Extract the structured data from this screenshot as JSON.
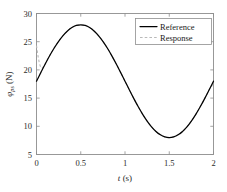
{
  "chart_data": {
    "type": "line",
    "title": "",
    "xlabel": "t (s)",
    "xlabel_sym": "t",
    "xlabel_unit": "(s)",
    "ylabel": "φ_ps (N)",
    "ylabel_sym": "φ",
    "ylabel_sub": "ps",
    "ylabel_unit": "(N)",
    "xlim": [
      0,
      2
    ],
    "ylim": [
      5,
      30
    ],
    "xticks": [
      0,
      0.5,
      1,
      1.5,
      2
    ],
    "xtick_labels": [
      "0",
      "0.5",
      "1",
      "1.5",
      "2"
    ],
    "yticks": [
      5,
      10,
      15,
      20,
      25,
      30
    ],
    "ytick_labels": [
      "5",
      "10",
      "15",
      "20",
      "25",
      "30"
    ],
    "grid": false,
    "legend_position": "upper-right",
    "series": [
      {
        "name": "Reference",
        "style": "solid",
        "color": "#000000",
        "x": [
          0,
          0.05,
          0.1,
          0.15,
          0.2,
          0.25,
          0.3,
          0.35,
          0.4,
          0.45,
          0.5,
          0.55,
          0.6,
          0.65,
          0.7,
          0.75,
          0.8,
          0.85,
          0.9,
          0.95,
          1.0,
          1.05,
          1.1,
          1.15,
          1.2,
          1.25,
          1.3,
          1.35,
          1.4,
          1.45,
          1.5,
          1.55,
          1.6,
          1.65,
          1.7,
          1.75,
          1.8,
          1.85,
          1.9,
          1.95,
          2.0
        ],
        "y": [
          18.0,
          19.56,
          21.09,
          22.54,
          23.88,
          25.07,
          26.09,
          26.91,
          27.51,
          27.88,
          28.0,
          27.88,
          27.51,
          26.91,
          26.09,
          25.07,
          23.88,
          22.54,
          21.09,
          19.56,
          18.0,
          16.44,
          14.91,
          13.46,
          12.12,
          10.93,
          9.91,
          9.09,
          8.49,
          8.12,
          8.0,
          8.12,
          8.49,
          9.09,
          9.91,
          10.93,
          12.12,
          13.46,
          14.91,
          16.44,
          18.0
        ]
      },
      {
        "name": "Response",
        "style": "dashed",
        "color": "#b9b9b9",
        "x": [
          0,
          0.01,
          0.02,
          0.03,
          0.04,
          0.05,
          0.06,
          0.08,
          0.1,
          0.15,
          0.2,
          0.25,
          0.3,
          0.35,
          0.4,
          0.45,
          0.5,
          0.55,
          0.6,
          0.65,
          0.7,
          0.75,
          0.8,
          0.85,
          0.9,
          0.95,
          1.0,
          1.05,
          1.1,
          1.15,
          1.2,
          1.25,
          1.3,
          1.35,
          1.4,
          1.45,
          1.5,
          1.55,
          1.6,
          1.65,
          1.7,
          1.75,
          1.8,
          1.85,
          1.9,
          1.95,
          2.0
        ],
        "y": [
          24.3,
          23.2,
          22.2,
          21.4,
          20.8,
          20.4,
          20.3,
          20.6,
          21.15,
          22.56,
          23.9,
          25.08,
          26.1,
          26.92,
          27.52,
          27.89,
          28.0,
          27.88,
          27.51,
          26.91,
          26.09,
          25.07,
          23.88,
          22.54,
          21.09,
          19.56,
          18.0,
          16.44,
          14.91,
          13.46,
          12.12,
          10.93,
          9.91,
          9.09,
          8.49,
          8.12,
          8.0,
          8.12,
          8.49,
          9.09,
          9.91,
          10.93,
          12.12,
          13.46,
          14.91,
          16.44,
          17.6
        ]
      }
    ]
  },
  "legend": {
    "items": [
      {
        "label": "Reference"
      },
      {
        "label": "Response"
      }
    ]
  }
}
